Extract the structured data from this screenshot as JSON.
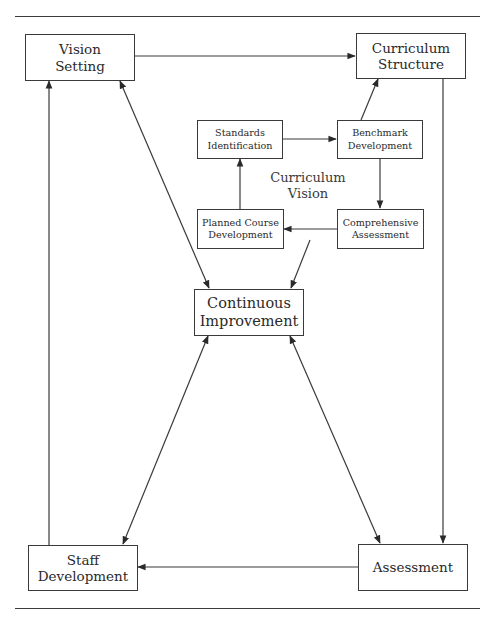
{
  "diagram": {
    "nodes": {
      "vision_setting": "Vision\nSetting",
      "curriculum_structure": "Curriculum\nStructure",
      "standards_identification": "Standards\nIdentification",
      "benchmark_development": "Benchmark\nDevelopment",
      "planned_course_development": "Planned Course\nDevelopment",
      "comprehensive_assessment": "Comprehensive\nAssessment",
      "continuous_improvement": "Continuous\nImprovement",
      "staff_development": "Staff\nDevelopment",
      "assessment": "Assessment"
    },
    "center_label": "Curriculum\nVision",
    "edges": [
      {
        "from": "Vision Setting",
        "to": "Curriculum Structure",
        "type": "arrow"
      },
      {
        "from": "Curriculum Structure",
        "to": "Assessment",
        "type": "arrow"
      },
      {
        "from": "Assessment",
        "to": "Staff Development",
        "type": "arrow"
      },
      {
        "from": "Staff Development",
        "to": "Vision Setting",
        "type": "arrow"
      },
      {
        "from": "Vision Setting",
        "to": "Continuous Improvement",
        "type": "bidirectional"
      },
      {
        "from": "Continuous Improvement",
        "to": "Staff Development",
        "type": "bidirectional"
      },
      {
        "from": "Continuous Improvement",
        "to": "Assessment",
        "type": "bidirectional"
      },
      {
        "from": "Standards Identification",
        "to": "Benchmark Development",
        "type": "arrow"
      },
      {
        "from": "Benchmark Development",
        "to": "Curriculum Structure",
        "type": "arrow"
      },
      {
        "from": "Benchmark Development",
        "to": "Comprehensive Assessment",
        "type": "arrow"
      },
      {
        "from": "Comprehensive Assessment",
        "to": "Planned Course Development",
        "type": "arrow"
      },
      {
        "from": "Planned Course Development",
        "to": "Standards Identification",
        "type": "arrow"
      },
      {
        "from": "Curriculum Vision",
        "to": "Continuous Improvement",
        "type": "arrow"
      }
    ],
    "colors": {
      "line": "#3a3a3a",
      "background": "#ffffff"
    }
  }
}
